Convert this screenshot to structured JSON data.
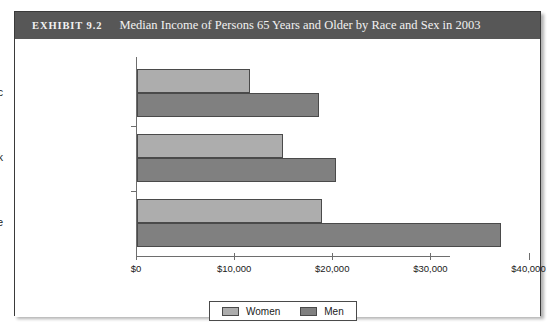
{
  "exhibit": {
    "label": "EXHIBIT 9.2",
    "title": "Median Income of Persons 65 Years and Older by Race and Sex in 2003"
  },
  "colors": {
    "header_band": "#575757",
    "women_bar": "#adadad",
    "men_bar": "#808080",
    "frame_border": "#3a3a3a",
    "axis": "#6e6e6e"
  },
  "chart_data": {
    "type": "bar",
    "orientation": "horizontal",
    "title": "Median Income of Persons 65 Years and Older by Race and Sex in 2003",
    "xlabel": "",
    "ylabel": "",
    "categories": [
      "Hispanic",
      "Black",
      "White"
    ],
    "series": [
      {
        "name": "Women",
        "values": [
          11500,
          14900,
          18850
        ],
        "color": "#adadad"
      },
      {
        "name": "Men",
        "values": [
          18500,
          20250,
          37050
        ],
        "color": "#808080"
      }
    ],
    "xlim": [
      0,
      40000
    ],
    "xticks": [
      0,
      10000,
      20000,
      30000,
      40000
    ],
    "xtick_labels": [
      "$0",
      "$10,000",
      "$20,000",
      "$30,000",
      "$40,000"
    ],
    "grid": false,
    "legend_position": "bottom",
    "legend_entries": [
      "Women",
      "Men"
    ]
  }
}
